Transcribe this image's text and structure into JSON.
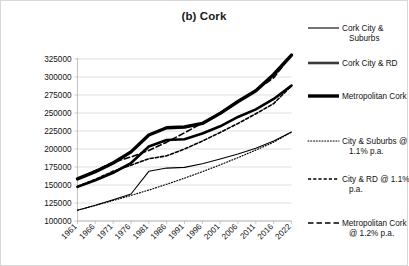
{
  "chart_data": {
    "type": "line",
    "title": "(b) Cork",
    "xlabel": "",
    "ylabel": "",
    "grid": true,
    "legend_position": "right",
    "ylim": [
      100000,
      325000
    ],
    "yticks": [
      100000,
      125000,
      150000,
      175000,
      200000,
      225000,
      250000,
      275000,
      300000,
      325000
    ],
    "ytick_labels": [
      "100000",
      "125000",
      "150000",
      "175000",
      "200000",
      "225000",
      "250000",
      "275000",
      "300000",
      "325000"
    ],
    "categories": [
      "1961",
      "1966",
      "1971",
      "1976",
      "1981",
      "1986",
      "1991",
      "1996",
      "2001",
      "2006",
      "2011",
      "2016",
      "2022"
    ],
    "x": [
      1961,
      1966,
      1971,
      1976,
      1981,
      1986,
      1991,
      1996,
      2001,
      2006,
      2011,
      2016,
      2022
    ],
    "series": [
      {
        "name": "Cork City & Suburbs",
        "style": "solid-thin",
        "color": "#000000",
        "width": 1.1,
        "values": [
          115000,
          122000,
          129500,
          137500,
          169000,
          173500,
          174500,
          179500,
          186000,
          193000,
          201000,
          211000,
          223500
        ]
      },
      {
        "name": "Cork City & RD",
        "style": "solid-medium",
        "color": "#3a3a3a",
        "width": 2.6,
        "values": [
          147500,
          156500,
          167000,
          180500,
          203500,
          212500,
          213500,
          221500,
          231500,
          244500,
          255000,
          269500,
          288000
        ]
      },
      {
        "name": "Metropolitan Cork",
        "style": "solid-thick",
        "color": "#000000",
        "width": 3.4,
        "values": [
          158500,
          168500,
          180500,
          196000,
          219500,
          229500,
          230500,
          235500,
          249500,
          266000,
          281000,
          303500,
          330500
        ]
      },
      {
        "name": "City & Suburbs @ 1.1% p.a.",
        "style": "dotted",
        "color": "#000000",
        "width": 1.2,
        "values": [
          115000,
          121500,
          128500,
          135500,
          143000,
          151000,
          159500,
          168500,
          178000,
          188000,
          198500,
          209500,
          223500
        ]
      },
      {
        "name": "City & RD @ 1.1% p.a.",
        "style": "dashed-short",
        "color": "#000000",
        "width": 1.6,
        "values": [
          147500,
          158000,
          169000,
          177500,
          186500,
          190500,
          200000,
          211000,
          223000,
          235500,
          249000,
          263000,
          288000
        ]
      },
      {
        "name": "Metropolitan Cork @ 1.2% p.a.",
        "style": "dashed-long",
        "color": "#000000",
        "width": 1.6,
        "values": [
          158500,
          170000,
          181500,
          189000,
          198000,
          209500,
          222500,
          236000,
          250500,
          265500,
          281500,
          299000,
          330500
        ]
      }
    ],
    "legend": [
      {
        "label_line1": "Cork City &",
        "label_line2": "Suburbs",
        "style": "solid-thin"
      },
      {
        "label_line1": "Cork City & RD",
        "label_line2": "",
        "style": "solid-medium"
      },
      {
        "label_line1": "Metropolitan Cork",
        "label_line2": "",
        "style": "solid-thick"
      },
      {
        "label_line1": "City & Suburbs @",
        "label_line2": "1.1% p.a.",
        "style": "dotted"
      },
      {
        "label_line1": "City & RD @ 1.1%",
        "label_line2": "p.a.",
        "style": "dashed-short"
      },
      {
        "label_line1": "Metropolitan Cork",
        "label_line2": "@ 1.2% p.a.",
        "style": "dashed-long"
      }
    ],
    "colors": {
      "gridline": "#c9c9c9",
      "axis": "#a8a8a8",
      "text": "#111111",
      "series_dark": "#000000",
      "series_gray": "#3a3a3a",
      "frame": "#d8d8d8"
    }
  }
}
